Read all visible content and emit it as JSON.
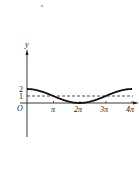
{
  "chart_data": {
    "type": "line",
    "title": "",
    "xlabel": "",
    "ylabel": "y",
    "origin_label": "O",
    "x_tick_labels": [
      "π",
      "2π",
      "3π",
      "4π"
    ],
    "x_tick_values": [
      3.1416,
      6.2832,
      9.4248,
      12.5664
    ],
    "y_tick_labels": [
      "2",
      "1"
    ],
    "y_tick_values": [
      2,
      1
    ],
    "xlim": [
      0,
      12.5664
    ],
    "ylim": [
      0,
      2
    ],
    "grid": false,
    "series": [
      {
        "name": "y = 1 + cos(x/2)",
        "style": "solid",
        "x": [
          0,
          3.1416,
          6.2832,
          9.4248,
          12.5664
        ],
        "values": [
          2,
          1,
          0,
          1,
          2
        ]
      },
      {
        "name": "y = 1",
        "style": "dashed",
        "x": [
          0,
          12.5664
        ],
        "values": [
          1,
          1
        ]
      }
    ]
  },
  "labels": {
    "y_axis": "y",
    "origin": "O",
    "y2": "2",
    "y1": "1",
    "pi": "π",
    "two_pi": "2π",
    "three_pi": "3π",
    "four_pi": "4π"
  }
}
